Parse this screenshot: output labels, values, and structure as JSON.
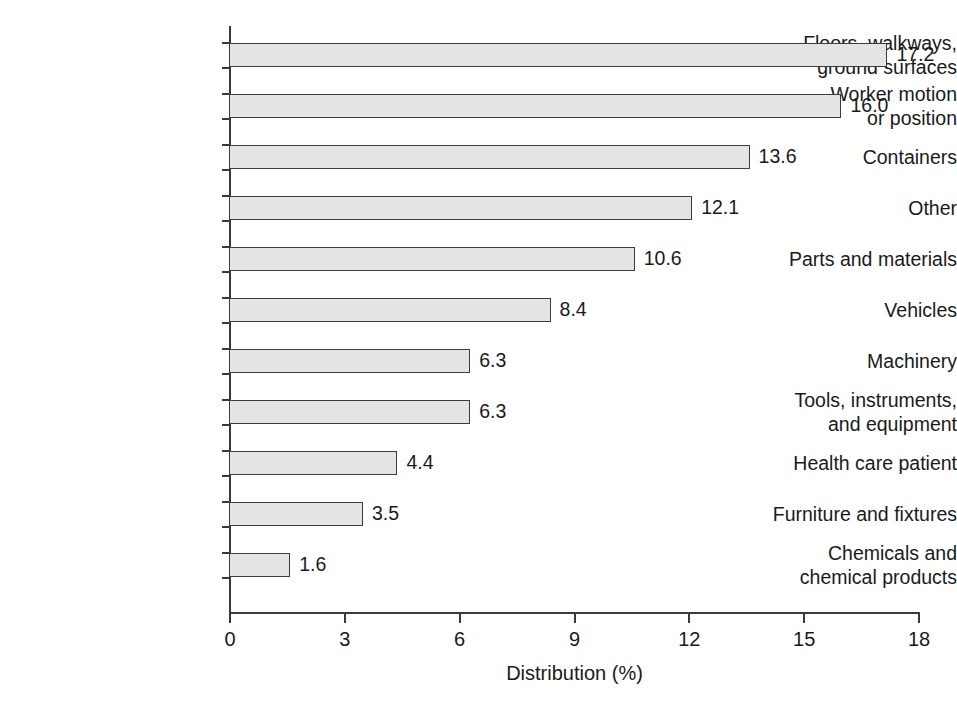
{
  "chart_data": {
    "type": "bar",
    "orientation": "horizontal",
    "title": "",
    "subtitle": "",
    "xlabel": "Distribution (%)",
    "ylabel": "",
    "xlim": [
      0,
      18
    ],
    "xticks": [
      "0",
      "3",
      "6",
      "9",
      "12",
      "15",
      "18"
    ],
    "xtick_values": [
      0,
      3,
      6,
      9,
      12,
      15,
      18
    ],
    "grid": false,
    "legend": null,
    "bar_fill_color": "#e4e4e4",
    "bar_border_color": "#3c3c3c",
    "axis_color": "#3a3a3a",
    "categories": [
      "Floors, walkways,\nground surfaces",
      "Worker motion\nor position",
      "Containers",
      "Other",
      "Parts and materials",
      "Vehicles",
      "Machinery",
      "Tools, instruments,\nand equipment",
      "Health care patient",
      "Furniture and fixtures",
      "Chemicals and\nchemical products"
    ],
    "values": [
      17.2,
      16.0,
      13.6,
      12.1,
      10.6,
      8.4,
      6.3,
      6.3,
      4.4,
      3.5,
      1.6
    ],
    "value_labels": [
      "17.2",
      "16.0",
      "13.6",
      "12.1",
      "10.6",
      "8.4",
      "6.3",
      "6.3",
      "4.4",
      "3.5",
      "1.6"
    ]
  }
}
